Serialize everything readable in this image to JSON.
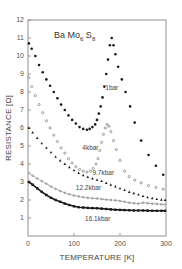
{
  "chart_data": {
    "type": "scatter",
    "title_main": "Ba Mo",
    "title_sub1": "6",
    "title_mid": " S",
    "title_sub2": "8",
    "xlabel": "TEMPERATURE [K]",
    "ylabel": "RESISTANCE [Ω]",
    "xlim": [
      0,
      300
    ],
    "ylim": [
      0,
      12
    ],
    "xticks": [
      0,
      100,
      200,
      300
    ],
    "yticks": [
      1,
      2,
      3,
      4,
      5,
      6,
      7,
      8,
      9,
      10,
      11,
      12
    ],
    "grid": false,
    "legend_position": "inline labels",
    "series": [
      {
        "name": "1bar",
        "marker": "filled-circle",
        "label_pos": [
          168,
          8.1
        ],
        "x": [
          2,
          8,
          16,
          24,
          32,
          40,
          48,
          56,
          64,
          72,
          80,
          88,
          96,
          104,
          112,
          120,
          128,
          134,
          140,
          146,
          150,
          154,
          158,
          162,
          166,
          170,
          174,
          178,
          182,
          186,
          190,
          196,
          204,
          212,
          222,
          232,
          246,
          262,
          278,
          294
        ],
        "values": [
          10.7,
          10.4,
          10.0,
          9.5,
          9.1,
          8.7,
          8.35,
          8.0,
          7.65,
          7.3,
          7.0,
          6.7,
          6.45,
          6.25,
          6.05,
          5.95,
          5.9,
          5.95,
          6.05,
          6.2,
          6.45,
          6.8,
          7.2,
          7.7,
          8.3,
          9.0,
          9.8,
          10.6,
          11.0,
          10.6,
          10.1,
          9.4,
          8.7,
          8.0,
          7.2,
          6.3,
          5.3,
          4.5,
          3.9,
          3.4
        ]
      },
      {
        "name": "4kbar",
        "marker": "open-circle",
        "label_pos": [
          118,
          4.8
        ],
        "x": [
          2,
          8,
          16,
          24,
          32,
          40,
          48,
          56,
          64,
          72,
          80,
          88,
          96,
          104,
          112,
          120,
          128,
          136,
          142,
          148,
          152,
          156,
          160,
          164,
          168,
          172,
          176,
          180,
          186,
          192,
          200,
          210,
          220,
          232,
          246,
          262,
          278,
          294
        ],
        "values": [
          8.8,
          8.3,
          7.8,
          7.3,
          6.85,
          6.4,
          6.0,
          5.6,
          5.25,
          4.9,
          4.6,
          4.3,
          4.05,
          3.85,
          3.7,
          3.6,
          3.55,
          3.6,
          3.75,
          4.0,
          4.3,
          4.75,
          5.2,
          5.65,
          6.0,
          6.2,
          6.1,
          5.8,
          5.3,
          4.8,
          4.2,
          3.6,
          3.3,
          3.1,
          2.95,
          2.8,
          2.7,
          2.6
        ]
      },
      {
        "name": "9.7kbar",
        "marker": "filled-triangle",
        "label_pos": [
          140,
          3.4
        ],
        "x": [
          2,
          10,
          20,
          30,
          40,
          50,
          60,
          70,
          80,
          90,
          100,
          110,
          120,
          130,
          140,
          150,
          160,
          170,
          180,
          190,
          200,
          210,
          220,
          230,
          240,
          250,
          260,
          270,
          280,
          290,
          298
        ],
        "values": [
          6.0,
          5.75,
          5.45,
          5.15,
          4.9,
          4.65,
          4.4,
          4.2,
          4.0,
          3.82,
          3.65,
          3.5,
          3.38,
          3.28,
          3.2,
          3.12,
          3.05,
          2.95,
          2.85,
          2.75,
          2.65,
          2.55,
          2.45,
          2.38,
          2.3,
          2.22,
          2.15,
          2.1,
          2.05,
          2.02,
          2.0
        ]
      },
      {
        "name": "12.2kbar",
        "marker": "open-small",
        "label_pos": [
          104,
          2.55
        ],
        "x": [
          2,
          10,
          20,
          30,
          40,
          50,
          60,
          70,
          80,
          90,
          100,
          110,
          120,
          130,
          140,
          150,
          160,
          170,
          180,
          190,
          200,
          210,
          220,
          230,
          240,
          250,
          260,
          270,
          280,
          290,
          298
        ],
        "values": [
          3.5,
          3.35,
          3.2,
          3.05,
          2.9,
          2.75,
          2.62,
          2.5,
          2.4,
          2.32,
          2.25,
          2.2,
          2.15,
          2.12,
          2.1,
          2.08,
          2.05,
          2.02,
          2.0,
          1.98,
          1.95,
          1.9,
          1.85,
          1.82,
          1.8,
          1.85,
          1.82,
          1.8,
          1.78,
          1.76,
          1.75
        ]
      },
      {
        "name": "16.1kbar",
        "marker": "filled-square",
        "label_pos": [
          124,
          0.85
        ],
        "x": [
          2,
          10,
          20,
          30,
          40,
          50,
          60,
          70,
          80,
          90,
          100,
          110,
          120,
          130,
          140,
          150,
          160,
          170,
          180,
          190,
          200,
          210,
          220,
          230,
          240,
          250,
          260,
          270,
          280,
          290,
          298
        ],
        "values": [
          3.0,
          2.85,
          2.65,
          2.45,
          2.28,
          2.12,
          2.0,
          1.9,
          1.8,
          1.72,
          1.65,
          1.6,
          1.58,
          1.56,
          1.55,
          1.54,
          1.52,
          1.5,
          1.48,
          1.46,
          1.45,
          1.44,
          1.43,
          1.42,
          1.42,
          1.42,
          1.41,
          1.4,
          1.4,
          1.4,
          1.4
        ]
      }
    ]
  },
  "colors": {
    "axis": "#777777",
    "marker": "#1a1a1a",
    "open_marker": "#666666",
    "text": "#444444"
  }
}
